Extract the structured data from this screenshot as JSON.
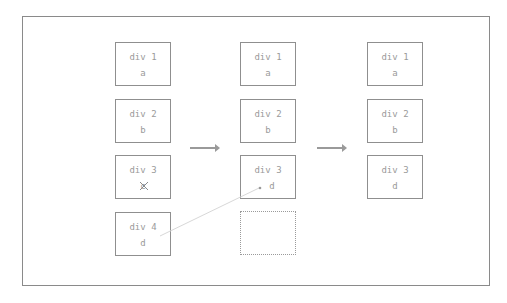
{
  "columns": [
    {
      "boxes": [
        {
          "label": "div 1",
          "value": "a"
        },
        {
          "label": "div 2",
          "value": "b"
        },
        {
          "label": "div 3",
          "value": "c",
          "struck": true
        },
        {
          "label": "div 4",
          "value": "d"
        }
      ]
    },
    {
      "boxes": [
        {
          "label": "div 1",
          "value": "a"
        },
        {
          "label": "div 2",
          "value": "b"
        },
        {
          "label": "div 3",
          "value": "d"
        },
        {
          "label": "",
          "value": "",
          "empty": true
        }
      ]
    },
    {
      "boxes": [
        {
          "label": "div 1",
          "value": "a"
        },
        {
          "label": "div 2",
          "value": "b"
        },
        {
          "label": "div 3",
          "value": "d"
        }
      ]
    }
  ],
  "colors": {
    "border": "#8f8f8f",
    "text": "#9a9a9a",
    "arrow": "#9a9a9a",
    "link_line": "#d8d8d8"
  }
}
